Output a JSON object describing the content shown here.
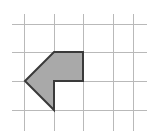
{
  "canvas": {
    "width": 153,
    "height": 137,
    "background_color": "#ffffff",
    "title": "Shaded arrow polygon on square grid"
  },
  "grid": {
    "line_color": "#b9b9b9",
    "line_width": 1,
    "cell_size": 29,
    "vertical_line_x": [
      24,
      54,
      83,
      113,
      133
    ],
    "horizontal_line_y": [
      24,
      52,
      81,
      110
    ],
    "x_extent": [
      12,
      147
    ],
    "y_extent": [
      14,
      131
    ]
  },
  "shape": {
    "name": "left-pointing-arrow",
    "type": "polygon",
    "sides": 6,
    "fill_color": "#a9a9a9",
    "stroke_color": "#3a3a3a",
    "stroke_width": 2,
    "vertices": [
      [
        25,
        81
      ],
      [
        54,
        52
      ],
      [
        83,
        52
      ],
      [
        83,
        81
      ],
      [
        54,
        81
      ],
      [
        54,
        110
      ]
    ],
    "points_string": "25,81 54,52 83,52 83,81 54,81 54,110"
  },
  "chart_data": {
    "type": "scatter",
    "xlabel": "",
    "ylabel": "",
    "grid": true,
    "legend": "none",
    "xlim": [
      0,
      153
    ],
    "ylim": [
      0,
      137
    ],
    "annotations": [],
    "series": [
      {
        "name": "arrow-polygon-vertices",
        "x": [
          25,
          54,
          83,
          83,
          54,
          54
        ],
        "y": [
          81,
          52,
          52,
          81,
          81,
          110
        ]
      },
      {
        "name": "grid-vertical-lines-x",
        "x": [
          24,
          54,
          83,
          113,
          133
        ],
        "y": [
          0,
          0,
          0,
          0,
          0
        ]
      },
      {
        "name": "grid-horizontal-lines-y",
        "x": [
          0,
          0,
          0,
          0
        ],
        "y": [
          24,
          52,
          81,
          110
        ]
      }
    ]
  }
}
